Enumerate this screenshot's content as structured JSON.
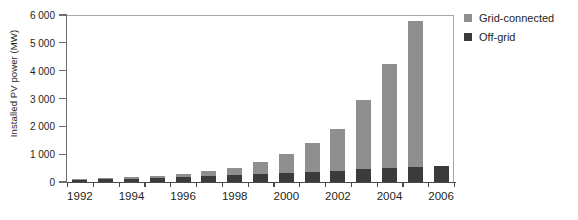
{
  "chart_data": {
    "type": "bar",
    "stacked": true,
    "title": "",
    "xlabel": "",
    "ylabel": "Installed PV power (MW)",
    "ylim": [
      0,
      6000
    ],
    "yticks": [
      0,
      1000,
      2000,
      3000,
      4000,
      5000,
      6000
    ],
    "ytick_labels": [
      "0",
      "1 000",
      "2 000",
      "3 000",
      "4 000",
      "5 000",
      "6 000"
    ],
    "grid": false,
    "legend_position": "top-right",
    "categories": [
      1992,
      1993,
      1994,
      1995,
      1996,
      1997,
      1998,
      1999,
      2000,
      2001,
      2002,
      2003,
      2004,
      2005,
      2006
    ],
    "xtick_labels": [
      "1992",
      "1994",
      "1996",
      "1998",
      "2000",
      "2002",
      "2004",
      "2006"
    ],
    "xtick_values": [
      1992,
      1994,
      1996,
      1998,
      2000,
      2002,
      2004,
      2006
    ],
    "series": [
      {
        "name": "Off-grid",
        "color": "#3b3b3b",
        "values": [
          85,
          105,
          125,
          150,
          175,
          205,
          240,
          280,
          325,
          370,
          410,
          450,
          490,
          530,
          570
        ]
      },
      {
        "name": "Grid-connected",
        "color": "#8f8f8f",
        "values": [
          15,
          25,
          45,
          70,
          115,
          175,
          280,
          430,
          700,
          1030,
          1490,
          2500,
          3740,
          5240,
          0
        ]
      }
    ],
    "totals": [
      100,
      130,
      170,
      220,
      290,
      380,
      520,
      710,
      1025,
      1400,
      1900,
      2950,
      4230,
      5770,
      570
    ],
    "annotations": []
  },
  "legend": {
    "items": [
      {
        "label": "Grid-connected",
        "color": "#8f8f8f"
      },
      {
        "label": "Off-grid",
        "color": "#3b3b3b"
      }
    ]
  }
}
